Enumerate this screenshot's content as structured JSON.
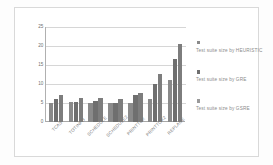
{
  "chart_data": {
    "type": "bar",
    "title": "",
    "xlabel": "",
    "ylabel": "",
    "ylim": [
      0,
      25
    ],
    "yticks": [
      0,
      5,
      10,
      15,
      20,
      25
    ],
    "grid": true,
    "legend_position": "right",
    "categories": [
      "TCAS",
      "TOTINFO",
      "SCHEDULE",
      "SCHEDULE2",
      "PRINTTOK",
      "PRINTTOK2",
      "REPLACE"
    ],
    "series": [
      {
        "name": "Test  suite size by HEURISTIC",
        "values": [
          5.0,
          5.3,
          5.0,
          5.0,
          5.0,
          6.0,
          11.0
        ]
      },
      {
        "name": "Test  suite size by GRE",
        "values": [
          6.0,
          5.3,
          5.5,
          5.0,
          7.0,
          10.0,
          16.5
        ]
      },
      {
        "name": "Test  suite size by GSRE",
        "values": [
          7.0,
          6.3,
          6.2,
          6.0,
          7.7,
          12.7,
          20.5
        ]
      }
    ],
    "colors": {
      "series_0": "#8a8a8a",
      "series_1": "#6f6f6f",
      "series_2": "#9a9a9a",
      "gridline": "#d6d6d6",
      "axis": "#a8a8a8",
      "tick_text": "#6e6e6e",
      "legend_text": "#8b8b8b",
      "plate_border": "#d9d9d9",
      "background": "#ffffff"
    }
  },
  "axis": {
    "ytick_labels": [
      "0",
      "5",
      "10",
      "15",
      "20",
      "25"
    ]
  },
  "legend": {
    "entries": [
      {
        "label": "Test  suite size by HEURISTIC",
        "swatch_name": "legend-swatch-heuristic"
      },
      {
        "label": "Test  suite size by GRE",
        "swatch_name": "legend-swatch-gre"
      },
      {
        "label": "Test  suite size by GSRE",
        "swatch_name": "legend-swatch-gsre"
      }
    ]
  }
}
